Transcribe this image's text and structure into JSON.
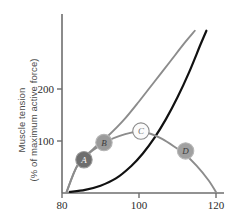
{
  "chart_data": {
    "type": "line",
    "title": "",
    "xlabel": "",
    "ylabel": "Muscle tension (% of maximum active force)",
    "ylabel_line1": "Muscle tension",
    "ylabel_line2": "(% of maximum active force)",
    "xlim": [
      80,
      120
    ],
    "ylim": [
      0,
      290
    ],
    "xticks": [
      80,
      100,
      120
    ],
    "xtick_labels": [
      "80",
      "100",
      "120"
    ],
    "yticks": [
      100,
      200
    ],
    "ytick_labels": [
      "100",
      "200"
    ],
    "grid": false,
    "legend": "none",
    "series": [
      {
        "name": "active-tension-curve",
        "color": "#8c8c8c",
        "x": [
          81.2,
          84.0,
          87.0,
          90.0,
          92.0,
          95.0,
          98.0,
          100.0,
          103.0,
          106.0,
          109.0,
          112.0,
          115.0,
          118.0,
          120.0
        ],
        "y": [
          2,
          53,
          76,
          92,
          101,
          110,
          116,
          118,
          114,
          104,
          90,
          74,
          52,
          25,
          2
        ]
      },
      {
        "name": "total-tension-curve",
        "color": "#8c8c8c",
        "x": [
          81.2,
          84.0,
          88.0,
          92.0,
          96.0,
          100.0,
          104.0,
          108.0,
          112.0,
          114.5
        ],
        "y": [
          2,
          53,
          84,
          110,
          140,
          176,
          214,
          252,
          290,
          312
        ]
      },
      {
        "name": "passive-tension-curve",
        "color": "#111111",
        "x": [
          82.0,
          86.0,
          90.0,
          94.0,
          98.0,
          101.0,
          104.0,
          107.0,
          110.0,
          113.0,
          116.0,
          117.5
        ],
        "y": [
          2,
          6,
          14,
          28,
          52,
          76,
          106,
          142,
          184,
          232,
          286,
          312
        ]
      }
    ],
    "markers": [
      {
        "id": "A",
        "label": "A",
        "x": 85.7,
        "y": 64,
        "fill": "#6e6e6e",
        "text_color": "#ffffff",
        "border": "#9a9a9a"
      },
      {
        "id": "B",
        "label": "B",
        "x": 90.9,
        "y": 97,
        "fill": "#9a9a9a",
        "text_color": "#3c3c3c",
        "border": "#b4b4b4"
      },
      {
        "id": "C",
        "label": "C",
        "x": 100.5,
        "y": 119,
        "fill": "#fbfbfb",
        "text_color": "#6e6e6e",
        "border": "#8c8c8c"
      },
      {
        "id": "D",
        "label": "D",
        "x": 112.1,
        "y": 81,
        "fill": "#a0a0a0",
        "text_color": "#3c3c3c",
        "border": "#b8b8b8"
      }
    ],
    "colors": {
      "axis": "#6e6e6e",
      "active_curve": "#8c8c8c",
      "total_curve": "#8c8c8c",
      "passive_curve": "#111111",
      "tick_text": "#2b2b2b",
      "axis_label_text": "#4b4b4b",
      "background": "#ffffff"
    }
  }
}
